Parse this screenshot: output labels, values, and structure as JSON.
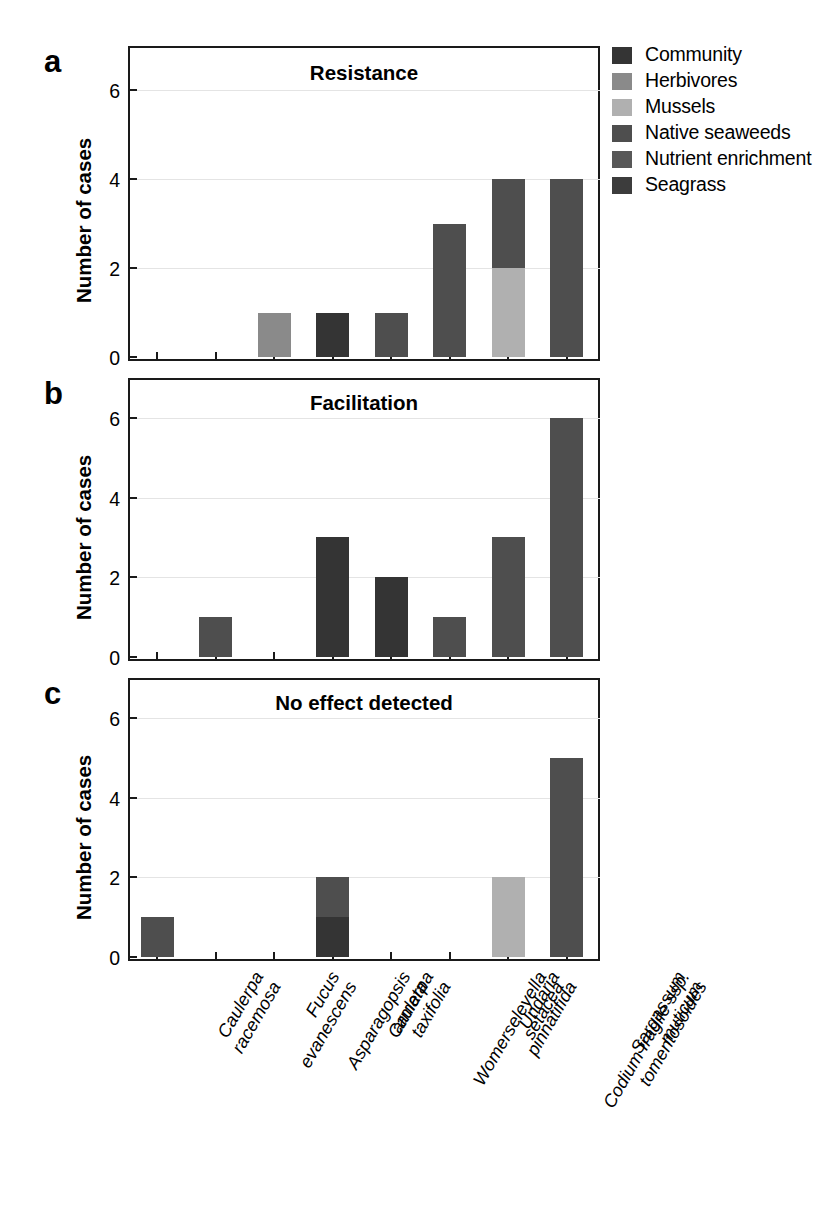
{
  "figure": {
    "panels": [
      {
        "letter": "a",
        "title": "Resistance",
        "ylabel": "Number of cases"
      },
      {
        "letter": "b",
        "title": "Facilitation",
        "ylabel": "Number of cases"
      },
      {
        "letter": "c",
        "title": "No effect detected",
        "ylabel": "Number of cases"
      }
    ]
  },
  "legend": {
    "items": [
      {
        "label": "Community",
        "color": "#343434"
      },
      {
        "label": "Herbivores",
        "color": "#8a8a8a"
      },
      {
        "label": "Mussels",
        "color": "#b0b0b0"
      },
      {
        "label": "Native seaweeds",
        "color": "#4e4e4e"
      },
      {
        "label": "Nutrient enrichment",
        "color": "#585858"
      },
      {
        "label": "Seagrass",
        "color": "#3c3c3c"
      }
    ]
  },
  "chart_data": [
    {
      "type": "bar",
      "title": "Resistance",
      "panel": "a",
      "xlabel": "",
      "ylabel": "Number of cases",
      "ylim": [
        0,
        7
      ],
      "yticks": [
        0,
        2,
        4,
        6
      ],
      "grid": true,
      "stacked": true,
      "categories": [
        "Caulerpa racemosa",
        "Fucus evanescens",
        "Asparagopsis armata",
        "Caulerpa taxifolia",
        "Womerseleyella setacea",
        "Undaria pinnatifida",
        "Codium fragile ssp. tomentosoides",
        "Sargassum muticum"
      ],
      "series": [
        {
          "name": "Community",
          "values": [
            0,
            0,
            0,
            1,
            0,
            0,
            0,
            0
          ]
        },
        {
          "name": "Herbivores",
          "values": [
            0,
            0,
            1,
            0,
            0,
            0,
            0,
            0
          ]
        },
        {
          "name": "Mussels",
          "values": [
            0,
            0,
            0,
            0,
            0,
            0,
            2,
            0
          ]
        },
        {
          "name": "Native seaweeds",
          "values": [
            0,
            0,
            0,
            0,
            1,
            3,
            2,
            4
          ]
        },
        {
          "name": "Nutrient enrichment",
          "values": [
            0,
            0,
            0,
            0,
            0,
            0,
            0,
            0
          ]
        },
        {
          "name": "Seagrass",
          "values": [
            0,
            0,
            0,
            0,
            0,
            0,
            0,
            0
          ]
        }
      ],
      "totals": [
        0,
        0,
        1,
        1,
        1,
        3,
        4,
        4
      ]
    },
    {
      "type": "bar",
      "title": "Facilitation",
      "panel": "b",
      "xlabel": "",
      "ylabel": "Number of cases",
      "ylim": [
        0,
        7
      ],
      "yticks": [
        0,
        2,
        4,
        6
      ],
      "grid": true,
      "stacked": true,
      "categories": [
        "Caulerpa racemosa",
        "Fucus evanescens",
        "Asparagopsis armata",
        "Caulerpa taxifolia",
        "Womerseleyella setacea",
        "Undaria pinnatifida",
        "Codium fragile ssp. tomentosoides",
        "Sargassum muticum"
      ],
      "series": [
        {
          "name": "Community",
          "values": [
            0,
            0,
            0,
            3,
            2,
            0,
            0,
            0
          ]
        },
        {
          "name": "Herbivores",
          "values": [
            0,
            0,
            0,
            0,
            0,
            0,
            0,
            0
          ]
        },
        {
          "name": "Mussels",
          "values": [
            0,
            0,
            0,
            0,
            0,
            0,
            0,
            0
          ]
        },
        {
          "name": "Native seaweeds",
          "values": [
            0,
            1,
            0,
            0,
            0,
            1,
            3,
            6
          ]
        },
        {
          "name": "Nutrient enrichment",
          "values": [
            0,
            0,
            0,
            0,
            0,
            0,
            0,
            0
          ]
        },
        {
          "name": "Seagrass",
          "values": [
            0,
            0,
            0,
            0,
            0,
            0,
            0,
            0
          ]
        }
      ],
      "totals": [
        0,
        1,
        0,
        3,
        2,
        1,
        3,
        6
      ]
    },
    {
      "type": "bar",
      "title": "No effect detected",
      "panel": "c",
      "xlabel": "",
      "ylabel": "Number of cases",
      "ylim": [
        0,
        7
      ],
      "yticks": [
        0,
        2,
        4,
        6
      ],
      "grid": true,
      "stacked": true,
      "categories": [
        "Caulerpa racemosa",
        "Fucus evanescens",
        "Asparagopsis armata",
        "Caulerpa taxifolia",
        "Womerseleyella setacea",
        "Undaria pinnatifida",
        "Codium fragile ssp. tomentosoides",
        "Sargassum muticum"
      ],
      "series": [
        {
          "name": "Community",
          "values": [
            0,
            0,
            0,
            1,
            0,
            0,
            0,
            0
          ]
        },
        {
          "name": "Herbivores",
          "values": [
            0,
            0,
            0,
            0,
            0,
            0,
            0,
            0
          ]
        },
        {
          "name": "Mussels",
          "values": [
            0,
            0,
            0,
            0,
            0,
            0,
            2,
            0
          ]
        },
        {
          "name": "Native seaweeds",
          "values": [
            1,
            0,
            0,
            1,
            0,
            0,
            0,
            5
          ]
        },
        {
          "name": "Nutrient enrichment",
          "values": [
            0,
            0,
            0,
            0,
            0,
            0,
            0,
            0
          ]
        },
        {
          "name": "Seagrass",
          "values": [
            0,
            0,
            0,
            0,
            0,
            0,
            0,
            0
          ]
        }
      ],
      "totals": [
        1,
        0,
        0,
        2,
        0,
        0,
        2,
        5
      ]
    }
  ],
  "xaxis": {
    "labels": [
      "Caulerpa\nracemosa",
      "Fucus\nevanescens",
      "Asparagopsis\narmata",
      "Caulerpa\ntaxifolia",
      "Womerseleyella\nsetacea",
      "Undaria\npinnatifida",
      "Codium fragile ssp.\ntomentosoides",
      "Sargassum\nmuticum"
    ]
  }
}
